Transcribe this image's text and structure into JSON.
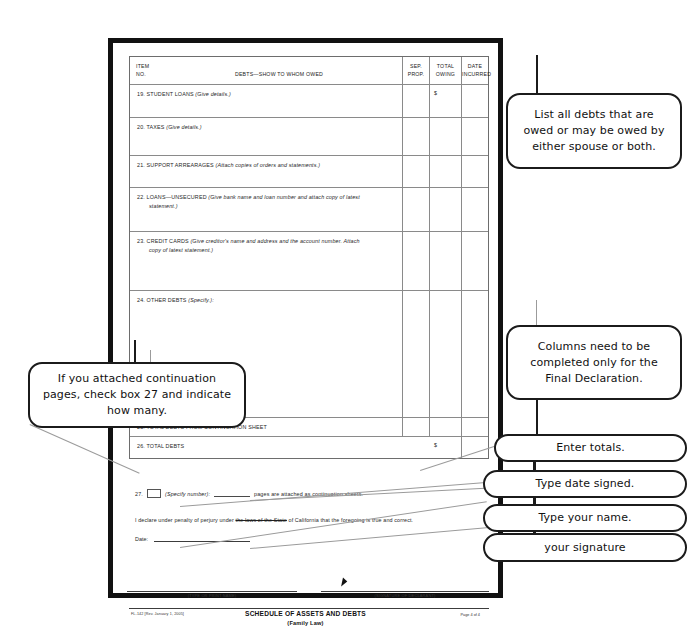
{
  "document": {
    "table": {
      "headers": {
        "item_no_line1": "ITEM",
        "item_no_line2": "NO.",
        "debts": "DEBTS—SHOW TO WHOM OWED",
        "sep_prop_line1": "SEP.",
        "sep_prop_line2": "PROP.",
        "total_owing_line1": "TOTAL",
        "total_owing_line2": "OWING",
        "date_incurred_line1": "DATE",
        "date_incurred_line2": "INCURRED"
      },
      "dollar_sign": "$",
      "rows": [
        {
          "no": "19.",
          "label": "STUDENT LOANS",
          "note": "(Give details.)"
        },
        {
          "no": "20.",
          "label": "TAXES",
          "note": "(Give details.)"
        },
        {
          "no": "21.",
          "label": "SUPPORT ARREARAGES",
          "note": "(Attach copies of orders and statements.)"
        },
        {
          "no": "22.",
          "label": "LOANS—UNSECURED",
          "note": "(Give bank name and loan number and attach copy of latest",
          "note2": "statement.)"
        },
        {
          "no": "23.",
          "label": "CREDIT CARDS",
          "note": "(Give creditor's name and address and the account number. Attach",
          "note2": "copy of latest statement.)"
        },
        {
          "no": "24.",
          "label": "OTHER DEBTS",
          "note": "(Specify.):"
        },
        {
          "no": "25.",
          "label": "TOTAL DEBTS FROM CONTINUATION SHEET",
          "note": ""
        },
        {
          "no": "26.",
          "label": "TOTAL DEBTS",
          "note": ""
        }
      ]
    },
    "item27": {
      "number": "27.",
      "specify_label": "(Specify number):",
      "tail": "pages are attached as continuation sheets."
    },
    "declaration": {
      "part1": "I declare under penalty of perjury under ",
      "struck": "the laws of the State",
      "part2": " of California that the foregoing is true and correct.",
      "date_label": "Date:"
    },
    "signature": {
      "type_or_print_name": "(TYPE OR PRINT NAME)",
      "signature_of_declarant": "(SIGNATURE OF DECLARANT)"
    },
    "footer": {
      "form_number": "FL-142 [Rev. January 1, 2005]",
      "title": "SCHEDULE OF ASSETS AND DEBTS",
      "subtitle": "(Family Law)",
      "page": "Page 4 of 4"
    }
  },
  "callouts": [
    {
      "id": "debts-scope",
      "text": "List all debts that are owed or may be owed by either spouse or both."
    },
    {
      "id": "columns-final",
      "text": "Columns need to be completed only for the Final Declaration."
    },
    {
      "id": "continuation-pages",
      "text": "If you attached continuation pages, check box 27 and indicate  how  many."
    },
    {
      "id": "enter-totals",
      "text": "Enter totals."
    },
    {
      "id": "type-date-signed",
      "text": "Type date signed."
    },
    {
      "id": "type-your-name",
      "text": "Type your name."
    },
    {
      "id": "your-signature",
      "text": "your  signature"
    }
  ],
  "colors": {
    "page_border": "#111111",
    "table_rule": "#8a8a8a",
    "callout_border": "#1b1b1b",
    "leader_line": "#9b9b9b"
  }
}
